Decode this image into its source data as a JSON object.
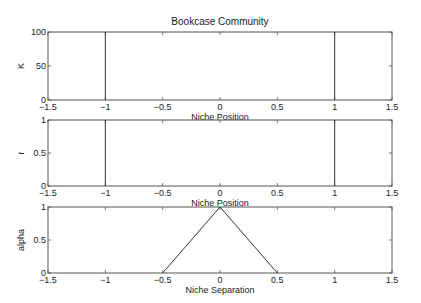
{
  "figure": {
    "title": "Bookcase Community",
    "width": 421,
    "height": 303,
    "line_color": "#333333",
    "axes_color": "#555555"
  },
  "chart_data": [
    {
      "type": "line",
      "title": "Bookcase Community",
      "xlabel": "Niche Position",
      "ylabel": "K",
      "xlim": [
        -1.5,
        1.5
      ],
      "ylim": [
        0,
        100
      ],
      "xticks": [
        -1.5,
        -1,
        -0.5,
        0,
        0.5,
        1,
        1.5
      ],
      "xtick_labels": [
        "−1.5",
        "−1",
        "−0.5",
        "0",
        "0.5",
        "1",
        "1.5"
      ],
      "yticks": [
        0,
        50,
        100
      ],
      "ytick_labels": [
        "0",
        "50",
        "100"
      ],
      "grid": false,
      "series": [
        {
          "name": "K at x=-1",
          "x": [
            -1,
            -1
          ],
          "y": [
            0,
            100
          ]
        },
        {
          "name": "K at x=1",
          "x": [
            1,
            1
          ],
          "y": [
            0,
            100
          ]
        }
      ],
      "box": {
        "left": 48,
        "top": 32,
        "right": 392,
        "bottom": 100
      }
    },
    {
      "type": "line",
      "title": "",
      "xlabel": "Niche Position",
      "ylabel": "r",
      "xlim": [
        -1.5,
        1.5
      ],
      "ylim": [
        0,
        1
      ],
      "xticks": [
        -1.5,
        -1,
        -0.5,
        0,
        0.5,
        1,
        1.5
      ],
      "xtick_labels": [
        "−1.5",
        "−1",
        "−0.5",
        "0",
        "0.5",
        "1",
        "1.5"
      ],
      "yticks": [
        0,
        0.5,
        1
      ],
      "ytick_labels": [
        "0",
        "0.5",
        "1"
      ],
      "grid": false,
      "series": [
        {
          "name": "r at x=-1",
          "x": [
            -1,
            -1
          ],
          "y": [
            0,
            1
          ]
        },
        {
          "name": "r at x=1",
          "x": [
            1,
            1
          ],
          "y": [
            0,
            1
          ]
        }
      ],
      "box": {
        "left": 48,
        "top": 120,
        "right": 392,
        "bottom": 186
      }
    },
    {
      "type": "line",
      "title": "",
      "xlabel": "Niche Separation",
      "ylabel": "alpha",
      "xlim": [
        -1.5,
        1.5
      ],
      "ylim": [
        0,
        1
      ],
      "xticks": [
        -1.5,
        -1,
        -0.5,
        0,
        0.5,
        1,
        1.5
      ],
      "xtick_labels": [
        "−1.5",
        "−1",
        "−0.5",
        "0",
        "0.5",
        "1",
        "1.5"
      ],
      "yticks": [
        0,
        0.5,
        1
      ],
      "ytick_labels": [
        "0",
        "0.5",
        "1"
      ],
      "grid": false,
      "series": [
        {
          "name": "alpha",
          "x": [
            -0.5,
            0,
            0.5
          ],
          "y": [
            0,
            1,
            0
          ]
        }
      ],
      "box": {
        "left": 48,
        "top": 207,
        "right": 392,
        "bottom": 273
      }
    }
  ]
}
